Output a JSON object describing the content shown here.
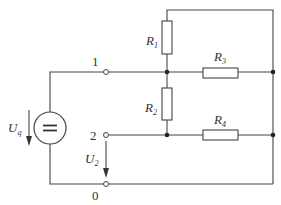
{
  "diagram": {
    "type": "circuit",
    "source": {
      "label": "U",
      "subscript": "q",
      "symbol": "dc-voltage-source"
    },
    "terminals": [
      {
        "id": "t1",
        "label": "1"
      },
      {
        "id": "t2",
        "label": "2"
      },
      {
        "id": "t0",
        "label": "0"
      }
    ],
    "resistors": [
      {
        "id": "R1",
        "label": "R",
        "subscript": "1"
      },
      {
        "id": "R2",
        "label": "R",
        "subscript": "2"
      },
      {
        "id": "R3",
        "label": "R",
        "subscript": "3"
      },
      {
        "id": "R4",
        "label": "R",
        "subscript": "4"
      }
    ],
    "output_voltage": {
      "label": "U",
      "subscript": "2"
    },
    "colors": {
      "wire": "#444444",
      "background": "#ffffff"
    }
  }
}
